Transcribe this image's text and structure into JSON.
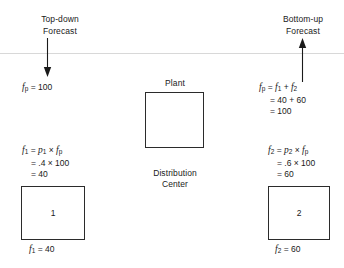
{
  "figure": {
    "type": "flow-diagram",
    "background": "#ffffff",
    "line_color": "#2b2b2b",
    "divider_color": "#d8d8d8"
  },
  "headers": {
    "top_down": {
      "line1": "Top-down",
      "line2": "Forecast"
    },
    "bottom_up": {
      "line1": "Bottom-up",
      "line2": "Forecast"
    }
  },
  "arrows": {
    "top_down_direction": "down",
    "bottom_up_direction": "up"
  },
  "left": {
    "plant_forecast": {
      "lhs": "f",
      "lhs_sub": "p",
      "rhs": "= 100"
    },
    "formula": {
      "line1": {
        "lhs": "f",
        "lhs_sub": "1",
        "eq": "=",
        "t1": "p",
        "t1_sub": "1",
        "times": "×",
        "t2": "f",
        "t2_sub": "p"
      },
      "line2": "= .4 × 100",
      "line3": "= 40"
    },
    "node_label": "1",
    "node_value": {
      "lhs": "f",
      "lhs_sub": "1",
      "rhs": "= 40"
    }
  },
  "right": {
    "plant_forecast": {
      "line1": {
        "lhs": "f",
        "lhs_sub": "p",
        "eq": "=",
        "t1": "f",
        "t1_sub": "1",
        "plus": "+",
        "t2": "f",
        "t2_sub": "2"
      },
      "line2": "= 40 + 60",
      "line3": "= 100"
    },
    "formula": {
      "line1": {
        "lhs": "f",
        "lhs_sub": "2",
        "eq": "=",
        "t1": "p",
        "t1_sub": "2",
        "times": "×",
        "t2": "f",
        "t2_sub": "p"
      },
      "line2": "= .6 × 100",
      "line3": "= 60"
    },
    "node_label": "2",
    "node_value": {
      "lhs": "f",
      "lhs_sub": "2",
      "rhs": "= 60"
    }
  },
  "center": {
    "plant_label": "Plant",
    "distribution_center": {
      "line1": "Distribution",
      "line2": "Center"
    }
  }
}
